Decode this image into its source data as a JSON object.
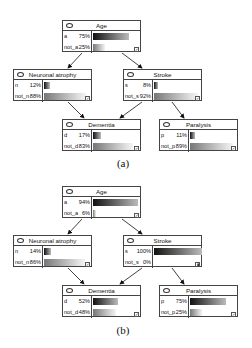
{
  "panels": [
    {
      "caption": "(a)",
      "nodes": {
        "age": {
          "title": "Age",
          "states": [
            {
              "label": "a",
              "pct": "75%",
              "value": 75
            },
            {
              "label": "not_a",
              "pct": "25%",
              "value": 25
            }
          ],
          "evidence_icon": "check-icon"
        },
        "neuronal": {
          "title": "Neuronal atrophy",
          "states": [
            {
              "label": "n",
              "pct": "12%",
              "value": 12
            },
            {
              "label": "not_n",
              "pct": "88%",
              "value": 88
            }
          ],
          "evidence_icon": "check-icon"
        },
        "stroke": {
          "title": "Stroke",
          "states": [
            {
              "label": "s",
              "pct": "8%",
              "value": 8
            },
            {
              "label": "not_s",
              "pct": "92%",
              "value": 92
            }
          ],
          "evidence_icon": "check-icon"
        },
        "dementia": {
          "title": "Dementia",
          "states": [
            {
              "label": "d",
              "pct": "17%",
              "value": 17
            },
            {
              "label": "not_d",
              "pct": "83%",
              "value": 83
            }
          ],
          "evidence_icon": "check-icon"
        },
        "paralysis": {
          "title": "Paralysis",
          "states": [
            {
              "label": "p",
              "pct": "11%",
              "value": 11
            },
            {
              "label": "not_p",
              "pct": "89%",
              "value": 89
            }
          ],
          "evidence_icon": "check-icon"
        }
      }
    },
    {
      "caption": "(b)",
      "nodes": {
        "age": {
          "title": "Age",
          "states": [
            {
              "label": "a",
              "pct": "94%",
              "value": 94
            },
            {
              "label": "not_a",
              "pct": "6%",
              "value": 6
            }
          ],
          "evidence_icon": "check-icon"
        },
        "neuronal": {
          "title": "Neuronal atrophy",
          "states": [
            {
              "label": "n",
              "pct": "14%",
              "value": 14
            },
            {
              "label": "not_n",
              "pct": "86%",
              "value": 86
            }
          ],
          "evidence_icon": "check-icon"
        },
        "stroke": {
          "title": "Stroke",
          "states": [
            {
              "label": "s",
              "pct": "100%",
              "value": 100
            },
            {
              "label": "not_s",
              "pct": "0%",
              "value": 0
            }
          ],
          "evidence_icon": "evidence-set-icon"
        },
        "dementia": {
          "title": "Dementia",
          "states": [
            {
              "label": "d",
              "pct": "52%",
              "value": 52
            },
            {
              "label": "not_d",
              "pct": "48%",
              "value": 48
            }
          ],
          "evidence_icon": "check-icon"
        },
        "paralysis": {
          "title": "Paralysis",
          "states": [
            {
              "label": "p",
              "pct": "75%",
              "value": 75
            },
            {
              "label": "not_p",
              "pct": "25%",
              "value": 25
            }
          ],
          "evidence_icon": "check-icon"
        }
      }
    }
  ],
  "edges": [
    [
      "age",
      "neuronal"
    ],
    [
      "age",
      "stroke"
    ],
    [
      "neuronal",
      "dementia"
    ],
    [
      "stroke",
      "dementia"
    ],
    [
      "stroke",
      "paralysis"
    ]
  ]
}
